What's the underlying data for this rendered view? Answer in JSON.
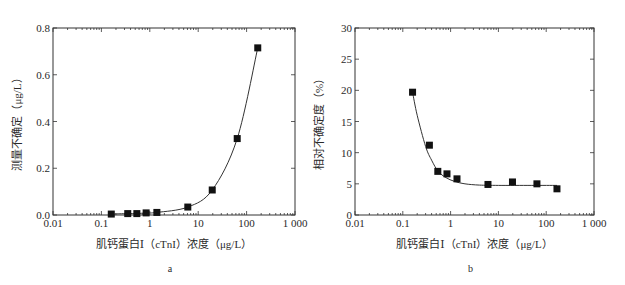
{
  "figure": {
    "panels": [
      {
        "id": "a",
        "caption": "a",
        "ylabel": "测量不确定（μg/L）",
        "xlabel": "肌钙蛋白Ⅰ（cTnI）浓度（μg/L）",
        "frame": {
          "x0": 53,
          "y0": 28,
          "x1": 295,
          "y1": 215
        },
        "xticks": [
          "0.01",
          "0.1",
          "1",
          "10",
          "100",
          "1 000"
        ],
        "yticks": [
          "0.0",
          "0.2",
          "0.4",
          "0.6",
          "0.8"
        ]
      },
      {
        "id": "b",
        "caption": "b",
        "ylabel": "相对不确定度（%）",
        "xlabel": "肌钙蛋白Ⅰ（cTnI）浓度（μg/L）",
        "frame": {
          "x0": 355,
          "y0": 28,
          "x1": 594,
          "y1": 215
        },
        "xticks": [
          "0.01",
          "0.1",
          "1",
          "10",
          "100",
          "1 000"
        ],
        "yticks": [
          "0",
          "5",
          "10",
          "15",
          "20",
          "25",
          "30"
        ]
      }
    ]
  },
  "chart_data": [
    {
      "type": "scatter",
      "title": "a",
      "xlabel": "肌钙蛋白Ⅰ（cTnI）浓度（μg/L）",
      "ylabel": "测量不确定（μg/L）",
      "xscale": "log",
      "xlim": [
        0.01,
        1000
      ],
      "ylim": [
        0,
        0.8
      ],
      "xticks": [
        0.01,
        0.1,
        1,
        10,
        100,
        1000
      ],
      "yticks": [
        0.0,
        0.2,
        0.4,
        0.6,
        0.8
      ],
      "grid": false,
      "legend": null,
      "series": [
        {
          "name": "measured uncertainty",
          "marker": "square",
          "fit_line": true,
          "x": [
            0.16,
            0.35,
            0.54,
            0.84,
            1.4,
            6.1,
            19.5,
            64,
            170
          ],
          "y": [
            0.004,
            0.006,
            0.006,
            0.009,
            0.011,
            0.034,
            0.107,
            0.327,
            0.715
          ]
        }
      ]
    },
    {
      "type": "scatter",
      "title": "b",
      "xlabel": "肌钙蛋白Ⅰ（cTnI）浓度（μg/L）",
      "ylabel": "相对不确定度（%）",
      "xscale": "log",
      "xlim": [
        0.01,
        1000
      ],
      "ylim": [
        0,
        30
      ],
      "xticks": [
        0.01,
        0.1,
        1,
        10,
        100,
        1000
      ],
      "yticks": [
        0,
        5,
        10,
        15,
        20,
        25,
        30
      ],
      "grid": false,
      "legend": null,
      "series": [
        {
          "name": "relative uncertainty",
          "marker": "square",
          "fit_line": true,
          "x": [
            0.16,
            0.36,
            0.54,
            0.84,
            1.36,
            6.05,
            19.7,
            64,
            168
          ],
          "y": [
            19.7,
            11.2,
            7.0,
            6.6,
            5.8,
            4.9,
            5.3,
            5.0,
            4.2
          ]
        }
      ],
      "fit_curve": {
        "x": [
          0.16,
          0.2,
          0.3,
          0.4,
          0.55,
          0.8,
          1.2,
          2,
          4,
          10,
          50,
          168
        ],
        "y": [
          19.7,
          16.0,
          11.0,
          8.8,
          7.0,
          6.0,
          5.4,
          5.0,
          4.8,
          4.75,
          4.75,
          4.75
        ]
      }
    }
  ]
}
